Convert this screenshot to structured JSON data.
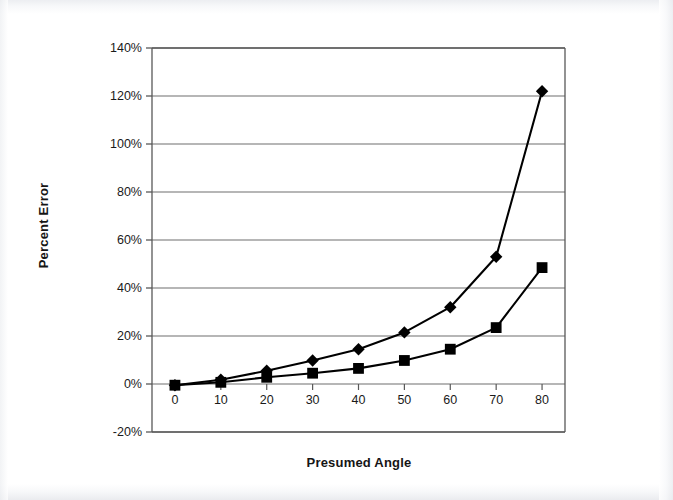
{
  "chart_data": {
    "type": "line",
    "title": "",
    "xlabel": "Presumed Angle",
    "ylabel": "Percent Error",
    "x": [
      0,
      10,
      20,
      30,
      40,
      50,
      60,
      70,
      80
    ],
    "xticklabels": [
      "0",
      "10",
      "20",
      "30",
      "40",
      "50",
      "60",
      "70",
      "80"
    ],
    "yticklabels": [
      "140%",
      "120%",
      "100%",
      "80%",
      "60%",
      "40%",
      "20%",
      "0%",
      "-20%"
    ],
    "ytickvalues": [
      140,
      120,
      100,
      80,
      60,
      40,
      20,
      0,
      -20
    ],
    "xlim": [
      -5,
      85
    ],
    "ylim": [
      -20,
      140
    ],
    "grid": "horizontal",
    "legend": "none",
    "series": [
      {
        "name": "series-diamond",
        "marker": "diamond",
        "color": "#000000",
        "values": [
          -0.5,
          1.8,
          5.5,
          9.8,
          14.5,
          21.5,
          32.0,
          53.0,
          122.0
        ]
      },
      {
        "name": "series-square",
        "marker": "square",
        "color": "#000000",
        "values": [
          -0.5,
          0.7,
          2.8,
          4.5,
          6.5,
          9.8,
          14.5,
          23.5,
          48.5
        ]
      }
    ]
  },
  "styling": {
    "plot_background": "#ffffff",
    "gridline_color": "#6f6f6f",
    "axis_color": "#585858",
    "text_color": "#151515",
    "page_background": "#ffffff"
  }
}
